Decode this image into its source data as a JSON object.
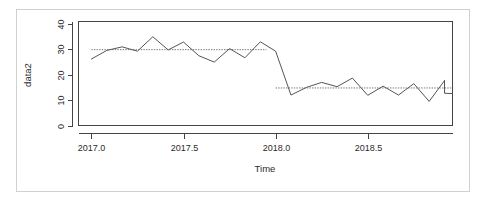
{
  "figure": {
    "background_color": "#ffffff",
    "frame_color": "#d0d0d0",
    "line_color": "#555555",
    "mean_line_color": "#777777",
    "axis_color": "#444444"
  },
  "chart_data": {
    "type": "line",
    "title": "",
    "xlabel": "Time",
    "ylabel": "data2",
    "xlim": [
      2016.93,
      2018.96
    ],
    "ylim": [
      0,
      41
    ],
    "grid": false,
    "legend": null,
    "xticks": [
      2017.0,
      2017.5,
      2018.0,
      2018.5
    ],
    "xticklabels": [
      "2017.0",
      "2017.5",
      "2018.0",
      "2018.5"
    ],
    "yticks": [
      0,
      10,
      20,
      30,
      40
    ],
    "yticklabels": [
      "0",
      "10",
      "20",
      "30",
      "40"
    ],
    "series": [
      {
        "name": "data2",
        "x": [
          2017.0,
          2017.0833,
          2017.1667,
          2017.25,
          2017.3333,
          2017.4167,
          2017.5,
          2017.5833,
          2017.6667,
          2017.75,
          2017.8333,
          2017.9167,
          2018.0,
          2018.0833,
          2018.1667,
          2018.25,
          2018.3333,
          2018.4167,
          2018.5,
          2018.5833,
          2018.6667,
          2018.75,
          2018.8333,
          2018.9167
        ],
        "y": [
          26.2,
          29.6,
          31.0,
          29.3,
          35.0,
          29.8,
          32.9,
          27.5,
          25.0,
          30.3,
          26.7,
          33.0,
          29.3,
          12.0,
          15.0,
          17.0,
          15.3,
          18.7,
          11.9,
          15.5,
          12.0,
          16.5,
          9.5,
          17.7
        ]
      }
    ],
    "annotations": [
      {
        "name": "mean-segment-1",
        "type": "horizontal-dotted-line",
        "value": 29.9,
        "x_start": 2017.0,
        "x_end": 2017.95
      },
      {
        "name": "mean-segment-2",
        "type": "horizontal-dotted-line",
        "value": 14.8,
        "x_start": 2018.0,
        "x_end": 2018.96
      }
    ],
    "tail": {
      "x": [
        2018.9167,
        2018.96
      ],
      "y": [
        12.7,
        12.6
      ]
    }
  }
}
